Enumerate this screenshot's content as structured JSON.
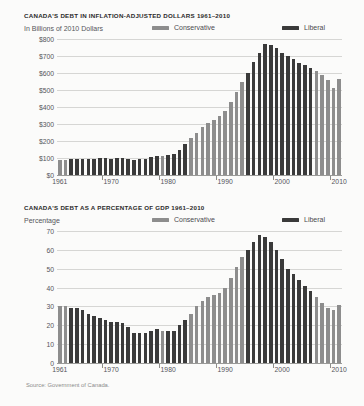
{
  "source_note": "Source: Government of Canada.",
  "colors": {
    "conservative": "#8d8d8d",
    "liberal": "#3a3a3a",
    "gridline": "#d6d6d4",
    "background": "#fbfbfa"
  },
  "legend": {
    "conservative_label": "Conservative",
    "liberal_label": "Liberal"
  },
  "chart_data": [
    {
      "type": "bar",
      "title": "CANADA'S DEBT IN INFLATION-ADJUSTED DOLLARS 1961–2010",
      "ylabel": "In Billions of 2010 Dollars",
      "xlabel": "",
      "ylim": [
        0,
        800
      ],
      "ytick_labels": [
        "$800",
        "$700",
        "$600",
        "$500",
        "$400",
        "$300",
        "$200",
        "$100",
        "$0"
      ],
      "ytick_values": [
        800,
        700,
        600,
        500,
        400,
        300,
        200,
        100,
        0
      ],
      "xtick_labels": [
        "1961",
        "1970",
        "1980",
        "1990",
        "2000",
        "2010"
      ],
      "xtick_values": [
        1961,
        1970,
        1980,
        1990,
        2000,
        2010
      ],
      "grid": true,
      "legend_position": "top-right",
      "categories": [
        1961,
        1962,
        1963,
        1964,
        1965,
        1966,
        1967,
        1968,
        1969,
        1970,
        1971,
        1972,
        1973,
        1974,
        1975,
        1976,
        1977,
        1978,
        1979,
        1980,
        1981,
        1982,
        1983,
        1984,
        1985,
        1986,
        1987,
        1988,
        1989,
        1990,
        1991,
        1992,
        1993,
        1994,
        1995,
        1996,
        1997,
        1998,
        1999,
        2000,
        2001,
        2002,
        2003,
        2004,
        2005,
        2006,
        2007,
        2008,
        2009,
        2010
      ],
      "values": [
        88,
        90,
        93,
        95,
        96,
        96,
        97,
        100,
        98,
        96,
        98,
        100,
        96,
        88,
        92,
        96,
        104,
        112,
        114,
        116,
        126,
        148,
        182,
        215,
        250,
        282,
        305,
        325,
        345,
        378,
        430,
        490,
        545,
        600,
        665,
        720,
        770,
        762,
        745,
        720,
        700,
        680,
        660,
        645,
        628,
        610,
        590,
        560,
        512,
        562
      ],
      "parties": [
        "Conservative",
        "Conservative",
        "Liberal",
        "Liberal",
        "Liberal",
        "Liberal",
        "Liberal",
        "Liberal",
        "Liberal",
        "Liberal",
        "Liberal",
        "Liberal",
        "Liberal",
        "Liberal",
        "Liberal",
        "Liberal",
        "Liberal",
        "Liberal",
        "Conservative",
        "Liberal",
        "Liberal",
        "Liberal",
        "Liberal",
        "Conservative",
        "Conservative",
        "Conservative",
        "Conservative",
        "Conservative",
        "Conservative",
        "Conservative",
        "Conservative",
        "Conservative",
        "Conservative",
        "Liberal",
        "Liberal",
        "Liberal",
        "Liberal",
        "Liberal",
        "Liberal",
        "Liberal",
        "Liberal",
        "Liberal",
        "Liberal",
        "Liberal",
        "Liberal",
        "Conservative",
        "Conservative",
        "Conservative",
        "Conservative",
        "Conservative"
      ]
    },
    {
      "type": "bar",
      "title": "CANADA'S DEBT AS A PERCENTAGE OF GDP 1961–2010",
      "ylabel": "Percentage",
      "xlabel": "",
      "ylim": [
        0,
        70
      ],
      "ytick_labels": [
        "70",
        "60",
        "50",
        "40",
        "30",
        "20",
        "10",
        "0"
      ],
      "ytick_values": [
        70,
        60,
        50,
        40,
        30,
        20,
        10,
        0
      ],
      "xtick_labels": [
        "1961",
        "1970",
        "1980",
        "1990",
        "2000",
        "2010"
      ],
      "xtick_values": [
        1961,
        1970,
        1980,
        1990,
        2000,
        2010
      ],
      "grid": true,
      "legend_position": "top-right",
      "categories": [
        1961,
        1962,
        1963,
        1964,
        1965,
        1966,
        1967,
        1968,
        1969,
        1970,
        1971,
        1972,
        1973,
        1974,
        1975,
        1976,
        1977,
        1978,
        1979,
        1980,
        1981,
        1982,
        1983,
        1984,
        1985,
        1986,
        1987,
        1988,
        1989,
        1990,
        1991,
        1992,
        1993,
        1994,
        1995,
        1996,
        1997,
        1998,
        1999,
        2000,
        2001,
        2002,
        2003,
        2004,
        2005,
        2006,
        2007,
        2008,
        2009,
        2010
      ],
      "values": [
        30,
        30,
        29,
        29,
        28,
        26,
        25,
        24,
        23,
        22,
        22,
        21,
        19,
        16,
        16,
        16,
        17,
        18,
        17,
        17,
        17,
        20,
        23,
        26,
        30,
        33,
        35,
        36,
        37,
        40,
        45,
        51,
        56,
        60,
        64,
        68,
        67,
        64,
        60,
        55,
        50,
        47,
        44,
        41,
        38,
        35,
        32,
        29,
        28,
        31
      ],
      "parties": [
        "Conservative",
        "Conservative",
        "Liberal",
        "Liberal",
        "Liberal",
        "Liberal",
        "Liberal",
        "Liberal",
        "Liberal",
        "Liberal",
        "Liberal",
        "Liberal",
        "Liberal",
        "Liberal",
        "Liberal",
        "Liberal",
        "Liberal",
        "Liberal",
        "Conservative",
        "Liberal",
        "Liberal",
        "Liberal",
        "Liberal",
        "Conservative",
        "Conservative",
        "Conservative",
        "Conservative",
        "Conservative",
        "Conservative",
        "Conservative",
        "Conservative",
        "Conservative",
        "Conservative",
        "Liberal",
        "Liberal",
        "Liberal",
        "Liberal",
        "Liberal",
        "Liberal",
        "Liberal",
        "Liberal",
        "Liberal",
        "Liberal",
        "Liberal",
        "Liberal",
        "Conservative",
        "Conservative",
        "Conservative",
        "Conservative",
        "Conservative"
      ]
    }
  ]
}
